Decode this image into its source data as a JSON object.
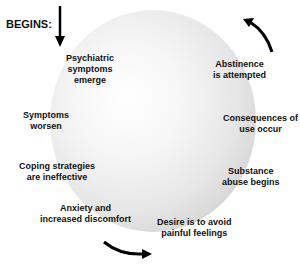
{
  "diagram": {
    "start_label": "BEGINS:",
    "cycle_steps": [
      {
        "id": "psychiatric",
        "text_lines": [
          "Psychiatric",
          "symptoms",
          "emerge"
        ]
      },
      {
        "id": "abstinence",
        "text_lines": [
          "Abstinence",
          "is attempted"
        ]
      },
      {
        "id": "consequences",
        "text_lines": [
          "Consequences of",
          "use occur"
        ]
      },
      {
        "id": "substance",
        "text_lines": [
          "Substance",
          "abuse begins"
        ]
      },
      {
        "id": "desire",
        "text_lines": [
          "Desire is to avoid",
          "painful feelings"
        ]
      },
      {
        "id": "anxiety",
        "text_lines": [
          "Anxiety and",
          "increased discomfort"
        ]
      },
      {
        "id": "coping",
        "text_lines": [
          "Coping strategies",
          "are ineffective"
        ]
      },
      {
        "id": "worsen",
        "text_lines": [
          "Symptoms",
          "worsen"
        ]
      }
    ],
    "arrows": [
      {
        "name": "start-arrow",
        "direction": "down"
      },
      {
        "name": "cycle-arrow-top-right",
        "direction": "counterclockwise-up"
      },
      {
        "name": "cycle-arrow-bottom",
        "direction": "right"
      }
    ],
    "colors": {
      "text": "#111111",
      "circle_light": "#ffffff",
      "circle_dark": "#c4c4c4",
      "arrow": "#000000"
    }
  }
}
